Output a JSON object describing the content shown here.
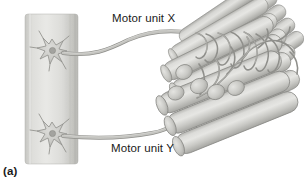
{
  "figure": {
    "panel_label": "(a)",
    "caption_labels": {
      "motor_unit_x": "Motor unit X",
      "motor_unit_y": "Motor unit Y"
    },
    "background_color": "#ffffff"
  },
  "diagram": {
    "title_text": "Motor units innervating skeletal muscle fibers",
    "type": "anatomical-illustration",
    "style": "grayscale halftone",
    "spinal_cord": {
      "name": "spinal-cord-column",
      "fill_light": "#e8e8e6",
      "fill_mid": "#d5d5d2",
      "fill_dark": "#bcbcb8",
      "x": 25,
      "y": 14,
      "width": 53,
      "height": 150
    },
    "neurons": [
      {
        "name": "motor-neuron-x-soma",
        "cx": 52,
        "cy": 50,
        "unit": "X",
        "nucleus_color": "#9a9a96",
        "body_color": "#cfcfcb",
        "outline_color": "#8a8a86"
      },
      {
        "name": "motor-neuron-y-soma",
        "cx": 52,
        "cy": 133,
        "unit": "Y",
        "nucleus_color": "#9a9a96",
        "body_color": "#cfcfcb",
        "outline_color": "#8a8a86"
      }
    ],
    "axons": [
      {
        "name": "axon-motor-unit-x",
        "unit": "X",
        "color": "#b5b5b1",
        "outline_color": "#8f8f8b"
      },
      {
        "name": "axon-motor-unit-y",
        "unit": "Y",
        "color": "#b5b5b1",
        "outline_color": "#8f8f8b"
      }
    ],
    "muscle": {
      "name": "muscle-fiber-bundle",
      "fiber_count": 22,
      "fill_light": "#e2e2df",
      "fill_mid": "#c9c9c5",
      "fill_dark": "#a9a9a5",
      "outline_color": "#8d8d89",
      "end_cap_color": "#bdbdb9"
    },
    "colors": {
      "text": "#1a1a1a",
      "line": "#8f8f8b",
      "paper": "#ffffff"
    }
  }
}
